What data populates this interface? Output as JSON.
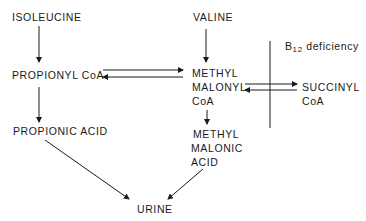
{
  "nodes": {
    "isoleucine": "ISOLEUCINE",
    "valine": "VALINE",
    "propionyl_coa": "PROPIONYL CoA",
    "methylmalonyl_coa": [
      "METHYL",
      "MALONYL",
      "CoA"
    ],
    "succinyl_coa": [
      "SUCCINYL",
      "CoA"
    ],
    "propionic_acid": "PROPIONIC ACID",
    "methylmalonic_acid": [
      "METHYL",
      "MALONIC",
      "ACID"
    ],
    "urine": "URINE"
  },
  "block": {
    "label_b": "B",
    "label_sub": "12",
    "label_rest": " deficiency"
  },
  "edges": [
    {
      "from": "ISOLEUCINE",
      "to": "PROPIONYL CoA"
    },
    {
      "from": "VALINE",
      "to": "METHYL MALONYL CoA"
    },
    {
      "from": "PROPIONYL CoA",
      "to": "METHYL MALONYL CoA",
      "bidirectional": true
    },
    {
      "from": "METHYL MALONYL CoA",
      "to": "SUCCINYL CoA",
      "bidirectional": true,
      "blocked_by": "B12 deficiency"
    },
    {
      "from": "PROPIONYL CoA",
      "to": "PROPIONIC ACID"
    },
    {
      "from": "METHYL MALONYL CoA",
      "to": "METHYL MALONIC ACID"
    },
    {
      "from": "PROPIONIC ACID",
      "to": "URINE"
    },
    {
      "from": "METHYL MALONIC ACID",
      "to": "URINE"
    }
  ]
}
